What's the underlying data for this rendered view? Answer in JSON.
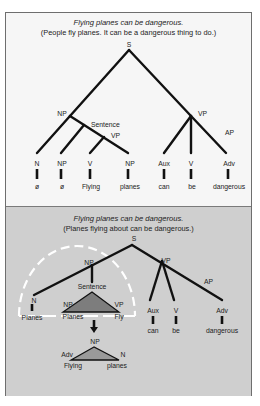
{
  "top_panel": {
    "title": "Flying planes can be dangerous.",
    "subtitle": "(People fly planes. It can be a dangerous thing to do.)",
    "nodes": {
      "S": "S",
      "NP": "NP",
      "Sentence": "Sentence",
      "VP_inner": "VP",
      "VP": "VP",
      "AP": "AP",
      "N": "N",
      "NP2": "NP",
      "V": "V",
      "NP3": "NP",
      "Aux": "Aux",
      "V2": "V",
      "Adv": "Adv"
    },
    "leaves": [
      "ø",
      "ø",
      "Flying",
      "planes",
      "can",
      "be",
      "dangerous"
    ]
  },
  "bottom_panel": {
    "title": "Flying planes can be dangerous.",
    "subtitle": "(Planes flying about can be dangerous.)",
    "nodes": {
      "S": "S",
      "NP": "NP",
      "VP": "VP",
      "AP": "AP",
      "N": "N",
      "Sentence": "Sentence",
      "Aux": "Aux",
      "V": "V",
      "Adv": "Adv",
      "tri_NP": "NP",
      "tri_VP": "VP",
      "NP_result": "NP",
      "tri2_Adv": "Adv",
      "tri2_N": "N"
    },
    "leaves": {
      "N": "Planes",
      "tri_left": "Planes",
      "tri_right": "Fly",
      "aux": "can",
      "v": "be",
      "adv": "dangerous",
      "tri2_left": "Flying",
      "tri2_right": "planes"
    }
  },
  "colors": {
    "top_bg": "#f6f6f6",
    "bottom_bg": "#cfcfcf",
    "line": "#111111",
    "triangle_fill": "#7d7d7d",
    "triangle2_fill": "#9a9a9a",
    "dashed": "#ffffff"
  }
}
